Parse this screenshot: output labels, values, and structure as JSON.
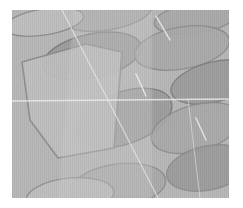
{
  "figure": {
    "name": "micrograph-panel",
    "kind": "grayscale-electron-micrograph",
    "alt_text": "Grayscale micrograph of overlapping lens-shaped platelet crystals with a large translucent fan-shaped plate and thin bright grain-boundary lines",
    "width": 243,
    "height": 208,
    "background_color": "#ffffff"
  },
  "image_field": {
    "name": "specimen-field",
    "x": 12,
    "y": 10,
    "width": 217,
    "height": 188,
    "matrix_color": "#b9b9b9",
    "matrix_color_light": "#c3c3c3",
    "vertical_stripe_opacity": 0.1,
    "noise_opacity": 0.07
  },
  "palette": {
    "white": "#ffffff",
    "bright_line": "#f2f2f2",
    "matrix_gray": "#b9b9b9",
    "plate_light": "#c2c2c2",
    "plate_mid": "#ababab",
    "plate_dark": "#9d9d9d",
    "plate_darker": "#8f8f8f",
    "outline_dark": "#7e7e7e",
    "outline_mid": "#8d8d8d",
    "overlay_translucent": "#cccccc"
  },
  "features": {
    "lens_platelets": [
      {
        "id": "lens-top-center",
        "cx": 108,
        "cy": 14,
        "rx": 44,
        "ry": 16,
        "rot": -10,
        "fill": "plate_mid",
        "stroke": "outline_mid",
        "opacity": 0.95
      },
      {
        "id": "lens-top-left",
        "cx": 44,
        "cy": 22,
        "rx": 40,
        "ry": 13,
        "rot": -9,
        "fill": "plate_light",
        "stroke": "outline_mid",
        "opacity": 0.95
      },
      {
        "id": "lens-top-right",
        "cx": 196,
        "cy": 18,
        "rx": 42,
        "ry": 15,
        "rot": -8,
        "fill": "plate_mid",
        "stroke": "outline_mid",
        "opacity": 0.9
      },
      {
        "id": "lens-upper-mid-left",
        "cx": 92,
        "cy": 56,
        "rx": 50,
        "ry": 22,
        "rot": -12,
        "fill": "plate_dark",
        "stroke": "outline_dark",
        "opacity": 0.95
      },
      {
        "id": "lens-upper-mid-right",
        "cx": 182,
        "cy": 48,
        "rx": 48,
        "ry": 21,
        "rot": -10,
        "fill": "plate_mid",
        "stroke": "outline_mid",
        "opacity": 0.9
      },
      {
        "id": "lens-mid-right",
        "cx": 214,
        "cy": 82,
        "rx": 44,
        "ry": 20,
        "rot": -14,
        "fill": "plate_dark",
        "stroke": "outline_dark",
        "opacity": 0.9
      },
      {
        "id": "lens-center",
        "cx": 124,
        "cy": 118,
        "rx": 50,
        "ry": 26,
        "rot": -20,
        "fill": "plate_dark",
        "stroke": "outline_dark",
        "opacity": 0.95
      },
      {
        "id": "lens-center-right",
        "cx": 196,
        "cy": 128,
        "rx": 46,
        "ry": 23,
        "rot": -16,
        "fill": "plate_mid",
        "stroke": "outline_mid",
        "opacity": 0.9
      },
      {
        "id": "lens-lower-right",
        "cx": 208,
        "cy": 168,
        "rx": 42,
        "ry": 22,
        "rot": -12,
        "fill": "plate_dark",
        "stroke": "outline_mid",
        "opacity": 0.9
      },
      {
        "id": "lens-bottom-center",
        "cx": 118,
        "cy": 186,
        "rx": 48,
        "ry": 22,
        "rot": -8,
        "fill": "plate_mid",
        "stroke": "outline_mid",
        "opacity": 0.9
      },
      {
        "id": "lens-bottom-left",
        "cx": 70,
        "cy": 196,
        "rx": 44,
        "ry": 18,
        "rot": -6,
        "fill": "plate_light",
        "stroke": "outline_mid",
        "opacity": 0.85
      }
    ],
    "fan_plate": {
      "id": "fan-plate-left",
      "points": "22,62 86,44 122,52 114,148 58,158 30,120",
      "fill": "plate_light",
      "stroke": "outline_mid",
      "opacity": 0.92
    },
    "translucent_overlay": {
      "id": "translucent-sheet",
      "points": "74,10 152,10 152,198 58,198",
      "fill": "overlay_translucent",
      "opacity": 0.38
    },
    "grain_boundaries": [
      {
        "id": "boundary-horizontal",
        "x1": 12,
        "y1": 101,
        "x2": 229,
        "y2": 99,
        "width": 1.3,
        "opacity": 0.85
      },
      {
        "id": "boundary-diagonal-main",
        "x1": 62,
        "y1": 10,
        "x2": 158,
        "y2": 198,
        "width": 1.2,
        "opacity": 0.7
      },
      {
        "id": "boundary-diagonal-short-top",
        "x1": 156,
        "y1": 16,
        "x2": 170,
        "y2": 40,
        "width": 1.4,
        "opacity": 0.95
      },
      {
        "id": "boundary-diagonal-short-mid",
        "x1": 136,
        "y1": 74,
        "x2": 146,
        "y2": 96,
        "width": 1.4,
        "opacity": 0.95
      },
      {
        "id": "boundary-diagonal-short-right",
        "x1": 196,
        "y1": 118,
        "x2": 206,
        "y2": 140,
        "width": 1.4,
        "opacity": 0.9
      },
      {
        "id": "boundary-vertical-right",
        "x1": 188,
        "y1": 99,
        "x2": 200,
        "y2": 198,
        "width": 1.0,
        "opacity": 0.55
      }
    ]
  }
}
